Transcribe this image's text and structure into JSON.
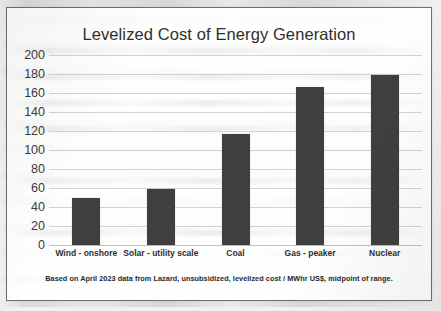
{
  "chart_data": {
    "type": "bar",
    "title": "Levelized Cost of Energy Generation",
    "categories": [
      "Wind - onshore",
      "Solar - utility scale",
      "Coal",
      "Gas - peaker",
      "Nuclear"
    ],
    "values": [
      50,
      59,
      117,
      166,
      179
    ],
    "xlabel": "",
    "ylabel": "",
    "ylim": [
      0,
      200
    ],
    "yticks": [
      200,
      180,
      160,
      140,
      120,
      100,
      80,
      60,
      40,
      20,
      0
    ],
    "grid": true,
    "legend": false,
    "bar_color": "#3f3f3f",
    "gridline_color": "#d2d2d2",
    "text_color": "#2e2e2e",
    "footnote": "Based on April 2023 data from Lazard, unsubsidized, levelized cost / MWhr US$, midpoint of range."
  }
}
